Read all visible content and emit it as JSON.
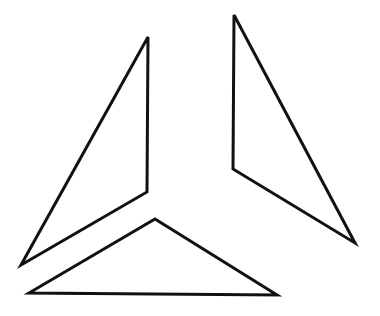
{
  "diagram": {
    "background": "#ffffff",
    "stroke_color": "#111111",
    "stroke_width": 3,
    "shapes": [
      {
        "name": "left-triangle",
        "type": "triangle",
        "points": [
          [
            148,
            37
          ],
          [
            21,
            265
          ],
          [
            147,
            192
          ]
        ]
      },
      {
        "name": "right-triangle",
        "type": "triangle",
        "points": [
          [
            234,
            15
          ],
          [
            233,
            169
          ],
          [
            355,
            243
          ]
        ]
      },
      {
        "name": "bottom-triangle",
        "type": "triangle",
        "points": [
          [
            29,
            293
          ],
          [
            155,
            219
          ],
          [
            277,
            295
          ]
        ]
      }
    ]
  }
}
